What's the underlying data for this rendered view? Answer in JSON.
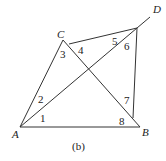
{
  "figure": {
    "caption": "(b)",
    "vertices": [
      {
        "name": "A",
        "x": 12,
        "y": 138
      },
      {
        "name": "B",
        "x": 142,
        "y": 136
      },
      {
        "name": "C",
        "x": 57,
        "y": 38
      },
      {
        "name": "D",
        "x": 153,
        "y": 13
      }
    ],
    "angles": [
      {
        "label": "1",
        "x": 40,
        "y": 122
      },
      {
        "label": "2",
        "x": 38,
        "y": 103
      },
      {
        "label": "3",
        "x": 60,
        "y": 58
      },
      {
        "label": "4",
        "x": 78,
        "y": 54
      },
      {
        "label": "5",
        "x": 112,
        "y": 45
      },
      {
        "label": "6",
        "x": 124,
        "y": 50
      },
      {
        "label": "7",
        "x": 124,
        "y": 104
      },
      {
        "label": "8",
        "x": 119,
        "y": 125
      }
    ]
  }
}
